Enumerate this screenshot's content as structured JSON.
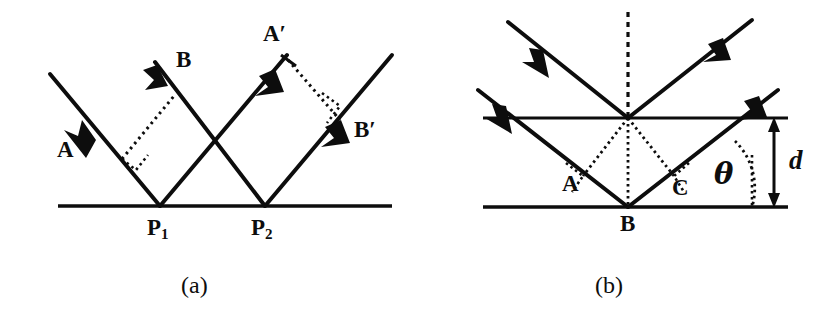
{
  "figure": {
    "background_color": "#ffffff",
    "ink_color": "#0d0d0d",
    "panels": [
      {
        "id": "a",
        "caption": "(a)",
        "description": "Two parallel incident rays A and B reflecting from a single crystal plane at points P1 and P2, with dotted perpendicular wavefront constructions before and after reflection.",
        "labels": {
          "incident_ray_1": "A",
          "incident_ray_2": "B",
          "reflected_ray_1": "A′",
          "reflected_ray_2": "B′",
          "point_1_base": "P",
          "point_1_sub": "1",
          "point_2_base": "P",
          "point_2_sub": "2"
        }
      },
      {
        "id": "b",
        "caption": "(b)",
        "description": "Two parallel atomic planes separated by spacing d. A ray reflects off the lower plane at B; perpendicular feet A and C define the extra path length. The glancing angle theta is marked with a dotted arc, and the interplanar spacing d is marked with a double-headed arrow.",
        "labels": {
          "foot_left": "A",
          "scatter_point": "B",
          "foot_right": "C",
          "angle": "θ",
          "spacing": "d"
        }
      }
    ]
  }
}
